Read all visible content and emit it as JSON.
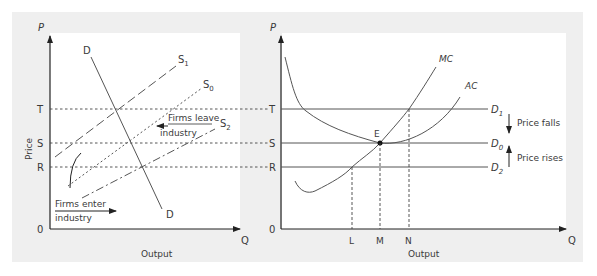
{
  "colors": {
    "frame": "#efefef",
    "panel": "#ffffff",
    "ink": "#3a3a3a",
    "line": "#555555"
  },
  "left_panel": {
    "y_axis_label": "P",
    "y_axis_title": "Price",
    "x_axis_label": "Q",
    "x_axis_title": "Output",
    "origin_label": "0",
    "price_levels": [
      {
        "label": "T",
        "style": "dashed"
      },
      {
        "label": "S",
        "style": "dashed"
      },
      {
        "label": "R",
        "style": "dashed"
      }
    ],
    "demand_label_top": "D",
    "demand_label_bottom": "D",
    "supply_curves": [
      {
        "label": "S",
        "subscript": "1",
        "style": "long-dash"
      },
      {
        "label": "S",
        "subscript": "0",
        "style": "dotted"
      },
      {
        "label": "S",
        "subscript": "2",
        "style": "dash-dot"
      }
    ],
    "annotation_leave_line1": "Firms leave",
    "annotation_leave_line2": "industry",
    "annotation_enter_line1": "Firms enter",
    "annotation_enter_line2": "industry"
  },
  "right_panel": {
    "y_axis_label": "P",
    "x_axis_label": "Q",
    "x_axis_title": "Output",
    "origin_label": "0",
    "price_levels": [
      {
        "label": "T",
        "demand": "D",
        "subscript": "1"
      },
      {
        "label": "S",
        "demand": "D",
        "subscript": "0"
      },
      {
        "label": "R",
        "demand": "D",
        "subscript": "2"
      }
    ],
    "curves": {
      "mc": "MC",
      "ac": "AC"
    },
    "equilibrium_label": "E",
    "output_ticks": [
      "L",
      "M",
      "N"
    ],
    "price_falls": "Price falls",
    "price_rises": "Price rises"
  }
}
